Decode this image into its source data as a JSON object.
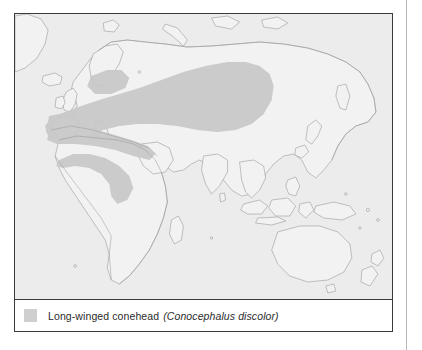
{
  "figure": {
    "type": "distribution-map",
    "legend": {
      "swatch_color": "#cfcfcf",
      "common_name": "Long-winged conehead",
      "scientific_name": "(Conocephalus discolor)"
    },
    "colors": {
      "range_fill": "#c8c8c8",
      "land_fill": "#efefef",
      "ocean_fill": "#ececec",
      "coastline": "#9a9a9a",
      "panel_border": "#3a3a3a",
      "column_rule": "#b9b9b9",
      "page_background": "#ffffff"
    },
    "projection_note": "World map centred on Europe / Asia",
    "range_regions": [
      "Western Europe",
      "Central Europe",
      "Mediterranean basin",
      "North Africa coast",
      "Southern Scandinavia",
      "Russia / Central Asia steppe belt",
      "West Africa coast"
    ]
  }
}
